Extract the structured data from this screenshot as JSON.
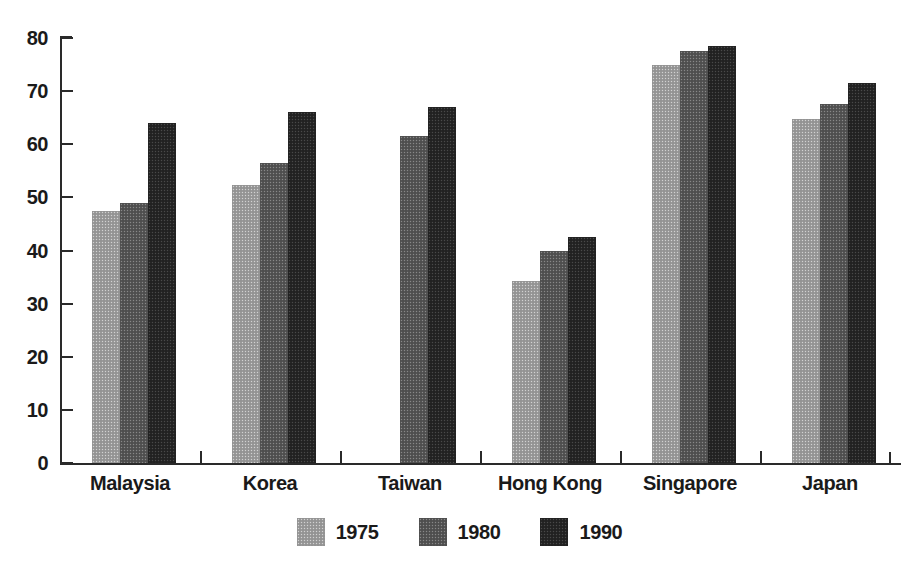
{
  "chart_data": {
    "type": "bar",
    "title": "",
    "subtitle": "",
    "xlabel": "",
    "ylabel": "",
    "ylim": [
      0,
      80
    ],
    "yticks": [
      0,
      10,
      20,
      30,
      40,
      50,
      60,
      70,
      80
    ],
    "ytick_labels": [
      "0",
      "10",
      "20",
      "30",
      "40",
      "50",
      "60",
      "70",
      "80"
    ],
    "grid": false,
    "legend_position": "bottom-center",
    "categories": [
      "Malaysia",
      "Korea",
      "Taiwan",
      "Hong Kong",
      "Singapore",
      "Japan"
    ],
    "series": [
      {
        "name": "1975",
        "color": "#9a9a9a",
        "values": [
          47.5,
          52.3,
          null,
          34.3,
          75.0,
          64.8
        ]
      },
      {
        "name": "1980",
        "color": "#555555",
        "values": [
          49.0,
          56.5,
          61.5,
          40.0,
          77.5,
          67.5
        ]
      },
      {
        "name": "1990",
        "color": "#262626",
        "values": [
          64.0,
          66.0,
          67.0,
          42.5,
          78.5,
          71.5
        ]
      }
    ]
  },
  "legend": {
    "items": [
      {
        "label": "1975",
        "color": "#9a9a9a"
      },
      {
        "label": "1980",
        "color": "#555555"
      },
      {
        "label": "1990",
        "color": "#262626"
      }
    ]
  },
  "axis": {
    "y_labels": [
      "80",
      "70",
      "60",
      "50",
      "40",
      "30",
      "20",
      "10",
      "0"
    ],
    "x_labels": [
      "Malaysia",
      "Korea",
      "Taiwan",
      "Hong Kong",
      "Singapore",
      "Japan"
    ]
  }
}
